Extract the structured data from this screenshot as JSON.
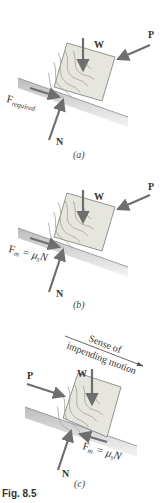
{
  "figure": {
    "caption": "Fig. 8.5",
    "colors": {
      "arrow": "#6e6e6e",
      "block_fill": "#e4e4dc",
      "grain": "#a8a8a0",
      "surface_top": "#c8c8c8",
      "surface_bottom": "#f2f2f2",
      "text": "#333333"
    },
    "panels": [
      {
        "id": "a",
        "label": "(a)",
        "forces": {
          "weight": "W",
          "push": "P",
          "normal": "N"
        },
        "friction_label": {
          "main": "F",
          "sub": "required"
        }
      },
      {
        "id": "b",
        "label": "(b)",
        "forces": {
          "weight": "W",
          "push": "P",
          "normal": "N"
        },
        "friction_label": {
          "main": "F",
          "sub": "m",
          "eq": " = μ",
          "eq_sub": "s",
          "tail": "N"
        }
      },
      {
        "id": "c",
        "label": "(c)",
        "forces": {
          "weight": "W",
          "push": "P",
          "normal": "N"
        },
        "friction_label": {
          "main": "F",
          "sub": "m",
          "eq": " = μ",
          "eq_sub": "s",
          "tail": "N"
        },
        "motion_note": {
          "line1": "Sense of",
          "line2": "impending motion"
        }
      }
    ]
  }
}
